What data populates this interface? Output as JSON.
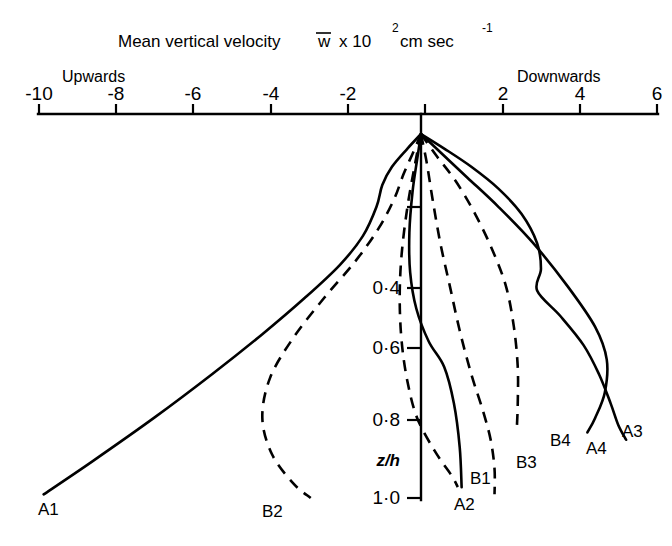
{
  "chart_data": {
    "type": "line",
    "title_parts": {
      "prefix": "Mean vertical velocity",
      "symbol": "w",
      "mult": "x 10",
      "exp1": "2",
      "unit": "cm sec",
      "exp2": "-1"
    },
    "xlabel": "Mean vertical velocity w̅ x 10² cm sec⁻¹",
    "ylabel": "z/h",
    "xlim": [
      -10,
      6
    ],
    "ylim": [
      1.0,
      0.0
    ],
    "grid": false,
    "legend": "inline-curve-end-labels",
    "x_ticks": [
      -10,
      -8,
      -6,
      -4,
      -2,
      0,
      2,
      4,
      6
    ],
    "x_tick_labels": [
      "-10",
      "-8",
      "-6",
      "-4",
      "-2",
      "",
      "2",
      "4",
      "6"
    ],
    "y_ticks": [
      0.2,
      0.4,
      0.6,
      0.8,
      1.0
    ],
    "y_tick_labels": [
      "",
      "0·4",
      "0·6",
      "0·8",
      "1·0"
    ],
    "direction_labels": {
      "left": "Upwards",
      "right": "Downwards"
    },
    "series": [
      {
        "name": "A1",
        "style": "solid",
        "label": "A1",
        "points": [
          [
            0.0,
            0.0
          ],
          [
            -0.35,
            0.04
          ],
          [
            -0.75,
            0.09
          ],
          [
            -1.0,
            0.14
          ],
          [
            -1.15,
            0.2
          ],
          [
            -1.5,
            0.28
          ],
          [
            -2.1,
            0.36
          ],
          [
            -3.0,
            0.45
          ],
          [
            -4.1,
            0.55
          ],
          [
            -5.4,
            0.66
          ],
          [
            -6.9,
            0.78
          ],
          [
            -8.5,
            0.9
          ],
          [
            -9.75,
            0.99
          ]
        ]
      },
      {
        "name": "A2",
        "style": "solid",
        "label": "A2",
        "points": [
          [
            0.0,
            0.0
          ],
          [
            -0.1,
            0.07
          ],
          [
            -0.22,
            0.16
          ],
          [
            -0.3,
            0.27
          ],
          [
            -0.28,
            0.38
          ],
          [
            -0.12,
            0.48
          ],
          [
            0.2,
            0.57
          ],
          [
            0.6,
            0.64
          ],
          [
            0.85,
            0.74
          ],
          [
            1.0,
            0.86
          ],
          [
            1.05,
            0.97
          ]
        ]
      },
      {
        "name": "A3",
        "style": "solid",
        "label": "A3",
        "points": [
          [
            0.0,
            0.0
          ],
          [
            0.6,
            0.04
          ],
          [
            1.3,
            0.09
          ],
          [
            2.0,
            0.15
          ],
          [
            2.6,
            0.22
          ],
          [
            3.0,
            0.3
          ],
          [
            3.1,
            0.37
          ],
          [
            3.0,
            0.43
          ],
          [
            3.6,
            0.5
          ],
          [
            4.2,
            0.58
          ],
          [
            4.6,
            0.66
          ],
          [
            4.9,
            0.74
          ],
          [
            5.1,
            0.8
          ],
          [
            5.3,
            0.84
          ]
        ]
      },
      {
        "name": "A4",
        "style": "solid",
        "label": "A4",
        "points": [
          [
            0.0,
            0.0
          ],
          [
            0.5,
            0.05
          ],
          [
            1.2,
            0.12
          ],
          [
            2.0,
            0.2
          ],
          [
            2.9,
            0.3
          ],
          [
            3.8,
            0.42
          ],
          [
            4.5,
            0.53
          ],
          [
            4.8,
            0.62
          ],
          [
            4.75,
            0.71
          ],
          [
            4.5,
            0.78
          ],
          [
            4.3,
            0.82
          ]
        ]
      },
      {
        "name": "B1",
        "style": "dashed",
        "label": "B1",
        "points": [
          [
            0.0,
            0.0
          ],
          [
            -0.15,
            0.08
          ],
          [
            -0.35,
            0.2
          ],
          [
            -0.5,
            0.33
          ],
          [
            -0.55,
            0.45
          ],
          [
            -0.5,
            0.57
          ],
          [
            -0.35,
            0.68
          ],
          [
            -0.1,
            0.78
          ],
          [
            0.35,
            0.87
          ],
          [
            0.8,
            0.94
          ],
          [
            0.95,
            0.97
          ]
        ]
      },
      {
        "name": "B2",
        "style": "dashed",
        "label": "B2",
        "points": [
          [
            0.0,
            0.0
          ],
          [
            -0.2,
            0.05
          ],
          [
            -0.45,
            0.11
          ],
          [
            -0.7,
            0.18
          ],
          [
            -1.1,
            0.26
          ],
          [
            -1.7,
            0.35
          ],
          [
            -2.5,
            0.45
          ],
          [
            -3.3,
            0.56
          ],
          [
            -3.9,
            0.67
          ],
          [
            -4.1,
            0.78
          ],
          [
            -3.85,
            0.88
          ],
          [
            -3.3,
            0.96
          ],
          [
            -2.85,
            1.0
          ]
        ]
      },
      {
        "name": "B3",
        "style": "dashed",
        "label": "B3",
        "points": [
          [
            0.0,
            0.0
          ],
          [
            0.4,
            0.06
          ],
          [
            0.9,
            0.13
          ],
          [
            1.4,
            0.22
          ],
          [
            1.85,
            0.32
          ],
          [
            2.2,
            0.42
          ],
          [
            2.4,
            0.53
          ],
          [
            2.5,
            0.64
          ],
          [
            2.5,
            0.74
          ],
          [
            2.48,
            0.8
          ]
        ]
      },
      {
        "name": "B4",
        "style": "dashed",
        "label": "B4",
        "points": [
          [
            0.0,
            0.0
          ],
          [
            0.15,
            0.08
          ],
          [
            0.3,
            0.18
          ],
          [
            0.5,
            0.3
          ],
          [
            0.75,
            0.42
          ],
          [
            1.0,
            0.54
          ],
          [
            1.3,
            0.66
          ],
          [
            1.6,
            0.76
          ],
          [
            1.8,
            0.84
          ],
          [
            1.9,
            0.92
          ],
          [
            1.9,
            0.99
          ]
        ]
      }
    ],
    "curve_end_labels": [
      {
        "label": "A1",
        "x": 38,
        "y": 511
      },
      {
        "label": "B2",
        "x": 262,
        "y": 513
      },
      {
        "label": "A2",
        "x": 454,
        "y": 506
      },
      {
        "label": "B1",
        "x": 470,
        "y": 480
      },
      {
        "label": "B3",
        "x": 516,
        "y": 464
      },
      {
        "label": "B4",
        "x": 550,
        "y": 442
      },
      {
        "label": "A4",
        "x": 586,
        "y": 450
      },
      {
        "label": "A3",
        "x": 622,
        "y": 433
      }
    ]
  }
}
